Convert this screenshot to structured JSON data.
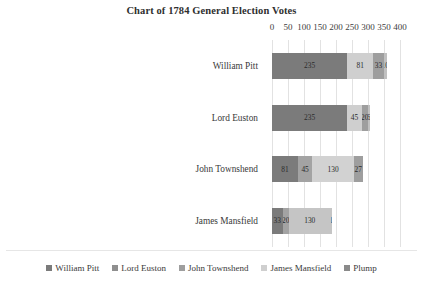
{
  "chart_data": {
    "type": "bar",
    "orientation": "horizontal",
    "stacked": true,
    "title": "Chart of 1784 General Election Votes",
    "xlabel": "",
    "ylabel": "",
    "xlim": [
      0,
      400
    ],
    "xticks": [
      0,
      50,
      100,
      150,
      200,
      250,
      300,
      350,
      400
    ],
    "grid": true,
    "legend_position": "bottom",
    "categories": [
      "William Pitt",
      "Lord Euston",
      "John Townshend",
      "James Mansfield"
    ],
    "series": [
      {
        "name": "William Pitt",
        "color": "#7b7b7b",
        "values": [
          235,
          235,
          81,
          33
        ]
      },
      {
        "name": "Lord Euston",
        "color": "#a0a0a0",
        "values": [
          0,
          0,
          45,
          20
        ]
      },
      {
        "name": "John Townshend",
        "color": "#c9c9c9",
        "values": [
          0,
          0,
          130,
          130
        ]
      },
      {
        "name": "James Mansfield",
        "color": "#d8d8d8",
        "values": [
          81,
          45,
          0,
          0
        ]
      },
      {
        "name": "Plump",
        "color": "#9a9a9a",
        "values": [
          33,
          20,
          27,
          1
        ]
      }
    ],
    "bars": [
      {
        "category": "William Pitt",
        "total": 359,
        "segments": [
          {
            "series": "William Pitt",
            "value": 235,
            "label": "235",
            "color": "#7b7b7b"
          },
          {
            "series": "James Mansfield",
            "value": 81,
            "label": "81",
            "color": "#cfcfcf"
          },
          {
            "series": "Plump",
            "value": 33,
            "label": "33",
            "color": "#9e9e9e"
          },
          {
            "series": "Extra",
            "value": 10,
            "label": "10",
            "color": "#c0c0c0"
          }
        ]
      },
      {
        "category": "Lord Euston",
        "total": 306,
        "segments": [
          {
            "series": "William Pitt",
            "value": 235,
            "label": "235",
            "color": "#7b7b7b"
          },
          {
            "series": "James Mansfield",
            "value": 45,
            "label": "45",
            "color": "#cfcfcf"
          },
          {
            "series": "Plump",
            "value": 20,
            "label": "20",
            "color": "#9e9e9e"
          },
          {
            "series": "Extra",
            "value": 6,
            "label": "6",
            "color": "#c0c0c0"
          }
        ]
      },
      {
        "category": "John Townshend",
        "total": 283,
        "segments": [
          {
            "series": "William Pitt",
            "value": 81,
            "label": "81",
            "color": "#7b7b7b"
          },
          {
            "series": "Lord Euston",
            "value": 45,
            "label": "45",
            "color": "#a3a3a3"
          },
          {
            "series": "John Townshend",
            "value": 130,
            "label": "130",
            "color": "#d2d2d2"
          },
          {
            "series": "Plump",
            "value": 27,
            "label": "27",
            "color": "#9e9e9e"
          }
        ]
      },
      {
        "category": "James Mansfield",
        "total": 184,
        "segments": [
          {
            "series": "William Pitt",
            "value": 33,
            "label": "33",
            "color": "#7b7b7b"
          },
          {
            "series": "Lord Euston",
            "value": 20,
            "label": "20",
            "color": "#a3a3a3"
          },
          {
            "series": "John Townshend",
            "value": 130,
            "label": "130",
            "color": "#c5c5c5"
          },
          {
            "series": "Plump",
            "value": 1,
            "label": "1",
            "color": "#c5c5c5"
          }
        ]
      }
    ],
    "legend": [
      {
        "label": "William Pitt",
        "color": "#7b7b7b"
      },
      {
        "label": "Lord Euston",
        "color": "#8f8f8f"
      },
      {
        "label": "John Townshend",
        "color": "#9e9e9e"
      },
      {
        "label": "James Mansfield",
        "color": "#cfcfcf"
      },
      {
        "label": "Plump",
        "color": "#8a8a8a"
      }
    ]
  }
}
